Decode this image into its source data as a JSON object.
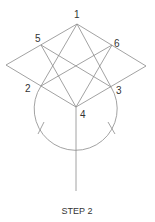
{
  "diagram": {
    "caption": "STEP 2",
    "line_color": "#8a8a8a",
    "text_color": "#333333",
    "points": {
      "p1": {
        "label": "1",
        "x": 77,
        "y": 24
      },
      "p2": {
        "label": "2",
        "x": 41,
        "y": 86
      },
      "p3": {
        "label": "3",
        "x": 111,
        "y": 87
      },
      "p4": {
        "label": "4",
        "x": 76,
        "y": 107
      },
      "p5": {
        "label": "5",
        "x": 41,
        "y": 45
      },
      "p6": {
        "label": "6",
        "x": 112,
        "y": 45
      }
    },
    "labels": [
      {
        "text": "1",
        "x": 74,
        "y": 18
      },
      {
        "text": "5",
        "x": 35,
        "y": 42
      },
      {
        "text": "6",
        "x": 114,
        "y": 47
      },
      {
        "text": "2",
        "x": 27,
        "y": 92
      },
      {
        "text": "3",
        "x": 116,
        "y": 94
      },
      {
        "text": "4",
        "x": 80,
        "y": 118
      }
    ]
  }
}
